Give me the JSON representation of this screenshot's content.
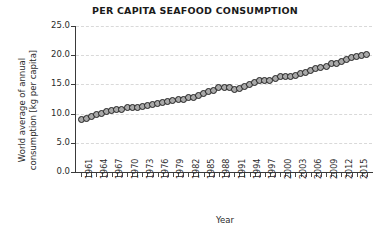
{
  "chart": {
    "title": "PER CAPITA SEAFOOD CONSUMPTION",
    "xlabel": "Year",
    "ylabel_line1": "World average of annual",
    "ylabel_line2": "consumption [kg per capita]"
  },
  "chart_data": {
    "type": "scatter",
    "title": "PER CAPITA SEAFOOD CONSUMPTION",
    "xlabel": "Year",
    "ylabel": "World average of annual consumption [kg per capita]",
    "xlim": [
      1960,
      2018
    ],
    "ylim": [
      0.0,
      25.0
    ],
    "grid": true,
    "legend": null,
    "ytick_labels": [
      "0.0",
      "5.0",
      "10.0",
      "15.0",
      "20.0",
      "25.0"
    ],
    "ytick_values": [
      0.0,
      5.0,
      10.0,
      15.0,
      20.0,
      25.0
    ],
    "xtick_labels": [
      "1961",
      "1964",
      "1967",
      "1970",
      "1973",
      "1976",
      "1979",
      "1982",
      "1985",
      "1988",
      "1991",
      "1994",
      "1997",
      "2000",
      "2003",
      "2006",
      "2009",
      "2012",
      "2015"
    ],
    "xtick_values": [
      1961,
      1964,
      1967,
      1970,
      1973,
      1976,
      1979,
      1982,
      1985,
      1988,
      1991,
      1994,
      1997,
      2000,
      2003,
      2006,
      2009,
      2012,
      2015
    ],
    "marker": {
      "shape": "circle",
      "facecolor": "#a8a8a8",
      "edgecolor": "#1f1f1f",
      "size": 7
    },
    "x": [
      1961,
      1962,
      1963,
      1964,
      1965,
      1966,
      1967,
      1968,
      1969,
      1970,
      1971,
      1972,
      1973,
      1974,
      1975,
      1976,
      1977,
      1978,
      1979,
      1980,
      1981,
      1982,
      1983,
      1984,
      1985,
      1986,
      1987,
      1988,
      1989,
      1990,
      1991,
      1992,
      1993,
      1994,
      1995,
      1996,
      1997,
      1998,
      1999,
      2000,
      2001,
      2002,
      2003,
      2004,
      2005,
      2006,
      2007,
      2008,
      2009,
      2010,
      2011,
      2012,
      2013,
      2014,
      2015,
      2016,
      2017
    ],
    "y": [
      9.0,
      9.2,
      9.5,
      9.8,
      10.0,
      10.3,
      10.6,
      10.7,
      10.7,
      11.1,
      11.1,
      11.0,
      11.2,
      11.4,
      11.5,
      11.8,
      11.9,
      12.0,
      12.2,
      12.4,
      12.5,
      12.7,
      12.8,
      13.1,
      13.4,
      13.8,
      14.0,
      14.4,
      14.4,
      14.5,
      14.2,
      14.3,
      14.6,
      15.0,
      15.4,
      15.6,
      15.7,
      15.6,
      16.0,
      16.3,
      16.4,
      16.4,
      16.5,
      16.8,
      17.1,
      17.3,
      17.7,
      17.9,
      18.0,
      18.5,
      18.6,
      19.0,
      19.3,
      19.6,
      19.8,
      19.9,
      20.1
    ]
  }
}
